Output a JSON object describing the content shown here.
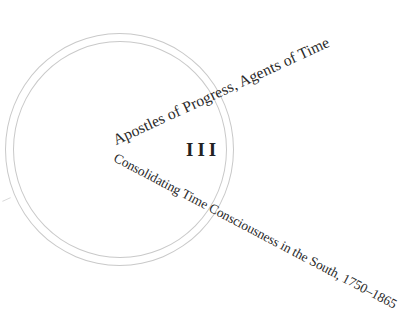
{
  "page": {
    "part_number": "III",
    "title": "Apostles of Progress, Agents of Time",
    "subtitle": "Consolidating Time Consciousness in the South, 1750–1865"
  },
  "decoration": {
    "rings": [
      "outer-ring",
      "inner-ring"
    ],
    "ring_color": "#c9c9c9",
    "text_color": "#2a2a2a"
  }
}
